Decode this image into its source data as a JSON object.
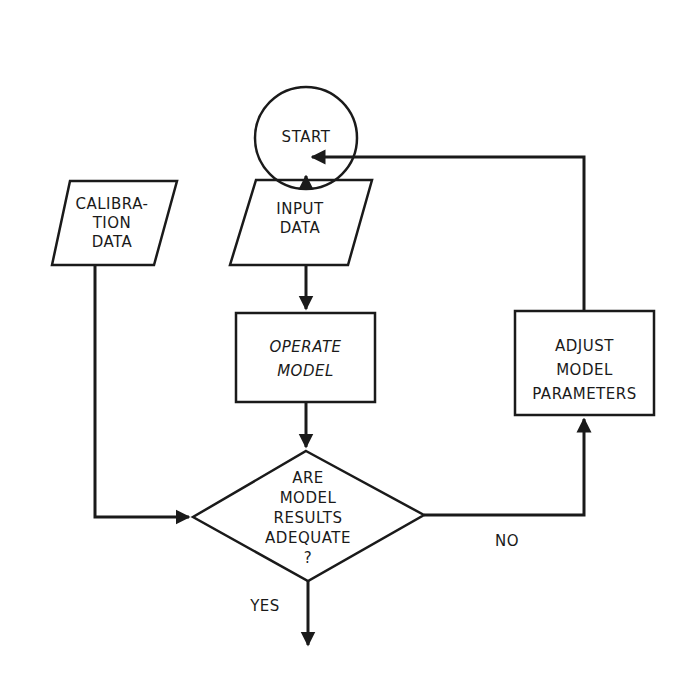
{
  "colors": {
    "stroke": "#1a1a1a",
    "background": "#ffffff"
  },
  "nodes": {
    "start": {
      "type": "terminator-circle",
      "label": "START"
    },
    "input_data": {
      "type": "input-parallelogram",
      "label": "INPUT\nDATA"
    },
    "calibration_data": {
      "type": "input-parallelogram",
      "label": "CALIBRA-\nTION\nDATA"
    },
    "operate_model": {
      "type": "process-rectangle",
      "label": "OPERATE\nMODEL"
    },
    "decision": {
      "type": "decision-diamond",
      "label": "ARE\nMODEL\nRESULTS\nADEQUATE\n?"
    },
    "adjust_params": {
      "type": "process-rectangle",
      "label": "ADJUST\nMODEL\nPARAMETERS"
    }
  },
  "edges": [
    {
      "from": "start",
      "to": "input_data",
      "label": ""
    },
    {
      "from": "input_data",
      "to": "operate_model",
      "label": ""
    },
    {
      "from": "operate_model",
      "to": "decision",
      "label": ""
    },
    {
      "from": "calibration_data",
      "to": "decision",
      "label": ""
    },
    {
      "from": "decision",
      "to": "adjust_params",
      "label": "NO"
    },
    {
      "from": "adjust_params",
      "to": "input_data",
      "label": ""
    },
    {
      "from": "decision",
      "to": "exit",
      "label": "YES"
    }
  ],
  "edge_labels": {
    "no": "NO",
    "yes": "YES"
  }
}
